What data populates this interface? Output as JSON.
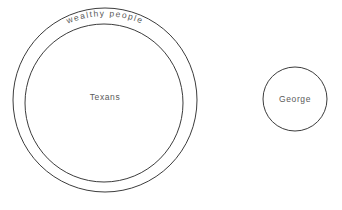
{
  "diagram": {
    "background_color": "#ffffff",
    "stroke_color": "#3c3c3c",
    "label_color": "#5a5a5a",
    "sets": [
      {
        "id": "wealthy-people",
        "label": "wealthy people",
        "shape": "circle",
        "label_style": "curved-along-top-arc",
        "cx": 105,
        "cy": 100,
        "r": 92
      },
      {
        "id": "texans",
        "label": "Texans",
        "shape": "circle",
        "label_style": "centered",
        "cx": 104,
        "cy": 103,
        "r": 79,
        "label_x": 105,
        "label_y": 100
      },
      {
        "id": "george",
        "label": "George",
        "shape": "circle",
        "label_style": "centered",
        "cx": 295,
        "cy": 99,
        "r": 32,
        "label_x": 295,
        "label_y": 102
      }
    ]
  }
}
